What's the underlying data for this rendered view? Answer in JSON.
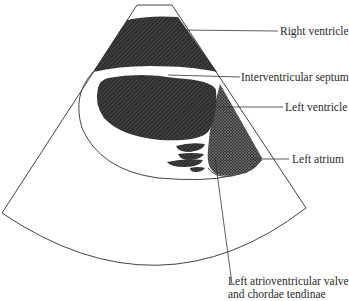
{
  "figure": {
    "colors": {
      "outline": "#444444",
      "chamber_fill": "#333333",
      "atrium_fill": "#4a4a4a",
      "background": "#ffffff",
      "label_text": "#2a2a2a"
    }
  },
  "labels": {
    "right_ventricle": "Right ventricle",
    "interventricular_septum": "Interventricular septum",
    "left_ventricle": "Left ventricle",
    "left_atrium": "Left atrium",
    "valve_line1": "Left atrioventricular valve",
    "valve_line2": "and chordae tendinae"
  }
}
